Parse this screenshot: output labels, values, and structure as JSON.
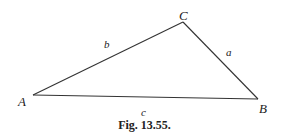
{
  "figure": {
    "caption": "Fig. 13.55.",
    "vertices": {
      "A": {
        "label": "A",
        "x": 33,
        "y": 95
      },
      "B": {
        "label": "B",
        "x": 258,
        "y": 99
      },
      "C": {
        "label": "C",
        "x": 183,
        "y": 22
      }
    },
    "sides": {
      "a": {
        "label": "a",
        "from": "B",
        "to": "C"
      },
      "b": {
        "label": "b",
        "from": "A",
        "to": "C"
      },
      "c": {
        "label": "c",
        "from": "A",
        "to": "B"
      }
    },
    "line_color": "#333333",
    "text_color": "#222222"
  }
}
